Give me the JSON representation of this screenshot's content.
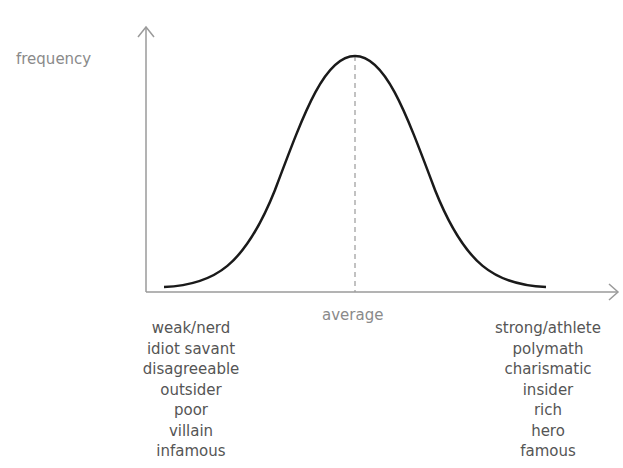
{
  "diagram": {
    "type": "bell-curve",
    "y_axis_label": "frequency",
    "center_label": "average",
    "left_labels": [
      "weak/nerd",
      "idiot savant",
      "disagreeable",
      "outsider",
      "poor",
      "villain",
      "infamous"
    ],
    "right_labels": [
      "strong/athlete",
      "polymath",
      "charismatic",
      "insider",
      "rich",
      "hero",
      "famous"
    ],
    "colors": {
      "axis": "#9a9a9a",
      "curve": "#1a1a1a",
      "label": "#8a8a8a",
      "text": "#555555"
    }
  }
}
